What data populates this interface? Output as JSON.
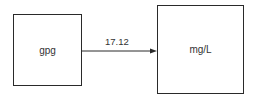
{
  "diagram": {
    "source_box": {
      "label": "gpg"
    },
    "target_box": {
      "label": "mg/L"
    },
    "arrow": {
      "label": "17.12",
      "from": "gpg",
      "to": "mg/L"
    }
  }
}
